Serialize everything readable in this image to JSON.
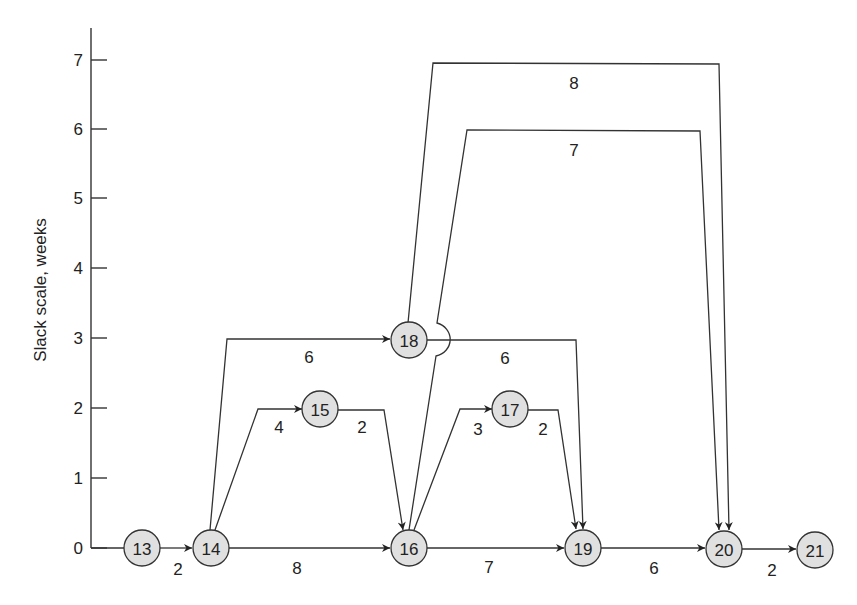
{
  "diagram": {
    "type": "network_slack_diagram",
    "y_axis": {
      "label": "Slack scale, weeks",
      "ticks": [
        "0",
        "1",
        "2",
        "3",
        "4",
        "5",
        "6",
        "7"
      ]
    },
    "nodes": [
      {
        "id": "13",
        "slack": 0
      },
      {
        "id": "14",
        "slack": 0
      },
      {
        "id": "15",
        "slack": 2
      },
      {
        "id": "16",
        "slack": 0
      },
      {
        "id": "17",
        "slack": 2
      },
      {
        "id": "18",
        "slack": 3
      },
      {
        "id": "19",
        "slack": 0
      },
      {
        "id": "20",
        "slack": 0
      },
      {
        "id": "21",
        "slack": 0
      }
    ],
    "edges": [
      {
        "from": "13",
        "to": "14",
        "duration": "2"
      },
      {
        "from": "14",
        "to": "16",
        "duration": "8"
      },
      {
        "from": "14",
        "to": "15",
        "duration": "4"
      },
      {
        "from": "15",
        "to": "16",
        "duration": "2"
      },
      {
        "from": "14",
        "to": "18",
        "duration": "6"
      },
      {
        "from": "16",
        "to": "19",
        "duration": "7"
      },
      {
        "from": "16",
        "to": "17",
        "duration": "3"
      },
      {
        "from": "17",
        "to": "19",
        "duration": "2"
      },
      {
        "from": "18",
        "to": "19",
        "duration": "6"
      },
      {
        "from": "16",
        "to": "20",
        "duration": "7"
      },
      {
        "from": "18",
        "to": "20",
        "duration": "8"
      },
      {
        "from": "19",
        "to": "20",
        "duration": "6"
      },
      {
        "from": "20",
        "to": "21",
        "duration": "2"
      }
    ]
  }
}
